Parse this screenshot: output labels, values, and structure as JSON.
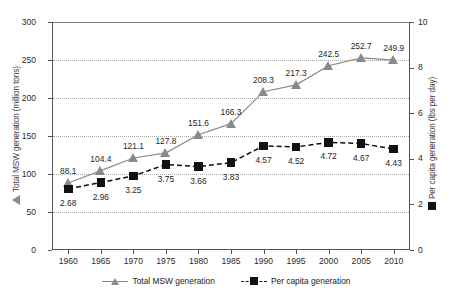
{
  "chart_data": {
    "type": "line",
    "title": "",
    "subtitle": "",
    "xlabel": "",
    "x": [
      1960,
      1965,
      1970,
      1975,
      1980,
      1985,
      1990,
      1995,
      2000,
      2005,
      2010
    ],
    "xtick_labels": [
      "1960",
      "1965",
      "1970",
      "1975",
      "1980",
      "1985",
      "1990",
      "1995",
      "2000",
      "2005",
      "2010"
    ],
    "grid": true,
    "grid_style": "dotted-horizontal",
    "legend_position": "bottom-center",
    "left_axis": {
      "label": "Total MSW generation (million tons)",
      "ylim": [
        0,
        300
      ],
      "ticks": [
        0,
        50,
        100,
        150,
        200,
        250,
        300
      ],
      "tick_labels": [
        "0",
        "50",
        "100",
        "150",
        "200",
        "250",
        "300"
      ],
      "marker_icon": "triangle-marker"
    },
    "right_axis": {
      "label": "Per capita generation (lbs per day)",
      "ylim": [
        0,
        10
      ],
      "ticks": [
        0,
        2,
        4,
        6,
        8,
        10
      ],
      "tick_labels": [
        "0",
        "2",
        "4",
        "6",
        "8",
        "10"
      ],
      "marker_icon": "square-marker"
    },
    "series": [
      {
        "name": "Total MSW generation",
        "axis": "left",
        "color": "#8a8a8a",
        "marker": "triangle",
        "line_style": "solid",
        "values": [
          88.1,
          104.4,
          121.1,
          127.8,
          151.6,
          166.3,
          208.3,
          217.3,
          242.5,
          252.7,
          249.9
        ],
        "data_labels": [
          "88.1",
          "104.4",
          "121.1",
          "127.8",
          "151.6",
          "166.3",
          "208.3",
          "217.3",
          "242.5",
          "252.7",
          "249.9"
        ]
      },
      {
        "name": "Per capita generation",
        "axis": "right",
        "color": "#111111",
        "marker": "square",
        "line_style": "dashed",
        "values": [
          2.68,
          2.96,
          3.25,
          3.75,
          3.66,
          3.83,
          4.57,
          4.52,
          4.72,
          4.67,
          4.43
        ],
        "data_labels": [
          "2.68",
          "2.96",
          "3.25",
          "3.75",
          "3.66",
          "3.83",
          "4.57",
          "4.52",
          "4.72",
          "4.67",
          "4.43"
        ]
      }
    ]
  },
  "legend": {
    "items": [
      {
        "label": "Total MSW generation",
        "icon": "triangle-marker",
        "color": "#8a8a8a"
      },
      {
        "label": "Per capita generation",
        "icon": "square-marker",
        "color": "#111111"
      }
    ]
  }
}
